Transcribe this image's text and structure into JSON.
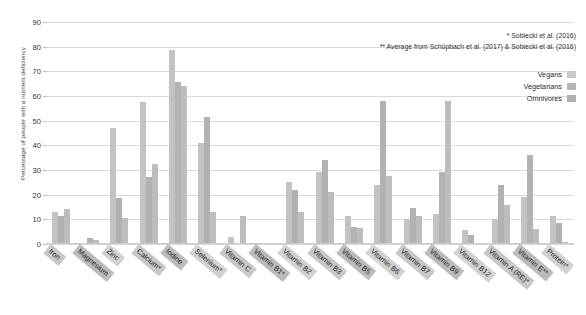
{
  "chart_data": {
    "type": "bar",
    "title": "",
    "xlabel": "",
    "ylabel": "Percentage of people with a nutrient deficiency",
    "ylim": [
      0,
      90
    ],
    "yticks": [
      0,
      10,
      20,
      30,
      40,
      50,
      60,
      70,
      80,
      90
    ],
    "grid": true,
    "legend_position": "top-right",
    "categories": [
      "Iron",
      "Magnesium",
      "Zinc",
      "Calcium*",
      "Iodine",
      "Selenium*",
      "Vitamin C",
      "Vitamin B1*",
      "Vitamin B2",
      "Vitamin B3",
      "Vitamin B5",
      "Vitamin B6",
      "Vitamin B7",
      "Vitamin B9",
      "Vitamin B12",
      "Vitamin A (RE)*",
      "Vitamin E**",
      "Protein*"
    ],
    "series": [
      {
        "name": "Vegans",
        "values": [
          13,
          0,
          47,
          57.5,
          78.5,
          41,
          3,
          0,
          25,
          29,
          11.5,
          24,
          10,
          12,
          5.5,
          10,
          19,
          11.5
        ]
      },
      {
        "name": "Vegetarians",
        "values": [
          11.5,
          2.5,
          18.5,
          27,
          65.5,
          51.5,
          0,
          0,
          22,
          34,
          7,
          58,
          14.5,
          29,
          3.5,
          24,
          36,
          8.5
        ]
      },
      {
        "name": "Omnivores",
        "values": [
          14,
          1.5,
          10.5,
          32.5,
          64,
          13,
          11.5,
          0,
          13,
          21,
          6.5,
          27.5,
          11.5,
          58,
          0.5,
          16,
          6,
          1
        ]
      }
    ],
    "annotations": [
      "* Sobiecki et al. (2016)",
      "** Average from Schüpbach et al. (2017) & Sobiecki et al. (2016)"
    ]
  }
}
